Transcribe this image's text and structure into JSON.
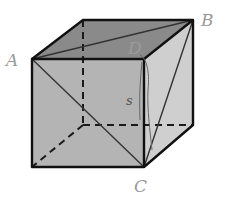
{
  "diagram": {
    "type": "cube",
    "labels": {
      "A": "A",
      "B": "B",
      "C": "C",
      "D": "D",
      "s": "s"
    },
    "colors": {
      "front_face": "#b4b4b4",
      "top_face": "#8a8a8a",
      "right_face": "#cfcfcf",
      "edge": "#1a1a1a",
      "label": "#9a9a9a"
    }
  }
}
